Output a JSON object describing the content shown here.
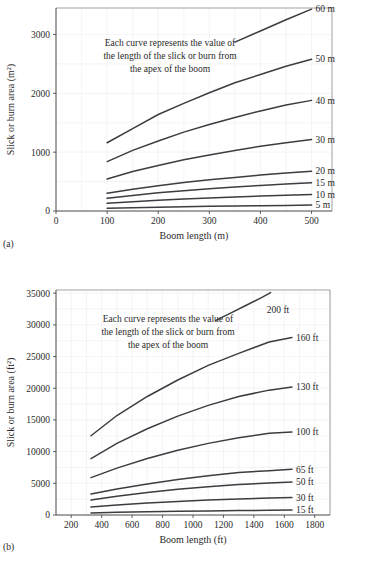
{
  "figure": {
    "panel_a_letter": "(a)",
    "panel_b_letter": "(b)",
    "annotation_line1": "Each curve represents the value of",
    "annotation_line2": "the length of the slick or burn from",
    "annotation_line3": "the apex of the boom",
    "curve_color": "#3c3c42",
    "grid_color": "#e9e7ea",
    "axis_color": "#3a3a3a"
  },
  "chart_data": [
    {
      "type": "line",
      "id": "panel-a",
      "title": "",
      "xlabel": "Boom length (m)",
      "ylabel": "Slick or burn area (m²)",
      "xlim": [
        0,
        540
      ],
      "ylim": [
        0,
        3450
      ],
      "xticks": [
        0,
        100,
        200,
        300,
        400,
        500
      ],
      "yticks": [
        0,
        1000,
        2000,
        3000
      ],
      "xtick_labels": [
        "0",
        "100",
        "200",
        "300",
        "400",
        "500"
      ],
      "ytick_labels": [
        "0",
        "1000",
        "2000",
        "3000"
      ],
      "grid": true,
      "legend_position": "right-of-curve-end",
      "annotation": "Each curve represents the value of the length of the slick or burn from the apex of the boom",
      "series": [
        {
          "name": "60 m",
          "label": "60 m",
          "x": [
            350,
            400,
            450,
            500
          ],
          "y": [
            2870,
            3060,
            3250,
            3430
          ]
        },
        {
          "name": "50 m",
          "label": "50 m",
          "x": [
            100,
            150,
            200,
            250,
            300,
            350,
            400,
            450,
            500
          ],
          "y": [
            1160,
            1400,
            1640,
            1830,
            2010,
            2180,
            2320,
            2460,
            2580
          ]
        },
        {
          "name": "40 m",
          "label": "40 m",
          "x": [
            100,
            150,
            200,
            250,
            300,
            350,
            400,
            450,
            500
          ],
          "y": [
            840,
            1030,
            1190,
            1340,
            1470,
            1590,
            1700,
            1800,
            1880
          ]
        },
        {
          "name": "30 m",
          "label": "30 m",
          "x": [
            100,
            150,
            200,
            250,
            300,
            350,
            400,
            450,
            500
          ],
          "y": [
            545,
            670,
            775,
            870,
            950,
            1030,
            1100,
            1160,
            1215
          ]
        },
        {
          "name": "20 m",
          "label": "20 m",
          "x": [
            100,
            150,
            200,
            250,
            300,
            350,
            400,
            450,
            500
          ],
          "y": [
            300,
            370,
            430,
            485,
            530,
            570,
            610,
            645,
            675
          ]
        },
        {
          "name": "15 m",
          "label": "15 m",
          "x": [
            100,
            150,
            200,
            250,
            300,
            350,
            400,
            450,
            500
          ],
          "y": [
            215,
            265,
            310,
            345,
            380,
            410,
            435,
            460,
            480
          ]
        },
        {
          "name": "10 m",
          "label": "10 m",
          "x": [
            100,
            150,
            200,
            250,
            300,
            350,
            400,
            450,
            500
          ],
          "y": [
            130,
            158,
            182,
            203,
            222,
            240,
            255,
            268,
            280
          ]
        },
        {
          "name": "5 m",
          "label": "5 m",
          "x": [
            100,
            150,
            200,
            250,
            300,
            350,
            400,
            450,
            500
          ],
          "y": [
            45,
            55,
            64,
            72,
            79,
            85,
            90,
            95,
            100
          ]
        }
      ]
    },
    {
      "type": "line",
      "id": "panel-b",
      "title": "",
      "xlabel": "Boom length (ft)",
      "ylabel": "Slick or burn area (ft²)",
      "xlim": [
        100,
        1900
      ],
      "ylim": [
        0,
        35500
      ],
      "xticks": [
        200,
        400,
        600,
        800,
        1000,
        1200,
        1400,
        1600,
        1800
      ],
      "yticks": [
        0,
        5000,
        10000,
        15000,
        20000,
        25000,
        30000,
        35000
      ],
      "xtick_labels": [
        "200",
        "400",
        "600",
        "800",
        "1000",
        "1200",
        "1400",
        "1600",
        "1800"
      ],
      "ytick_labels": [
        "0",
        "5000",
        "10000",
        "15000",
        "20000",
        "25000",
        "30000",
        "35000"
      ],
      "grid": true,
      "legend_position": "right-of-curve-end",
      "annotation": "Each curve represents the value of the length of the slick or burn from the apex of the boom",
      "series": [
        {
          "name": "200 ft",
          "label": "200 ft",
          "x": [
            1150,
            1250,
            1350,
            1450,
            1510
          ],
          "y": [
            30700,
            31900,
            33100,
            34300,
            35100
          ]
        },
        {
          "name": "160 ft",
          "label": "160 ft",
          "x": [
            330,
            500,
            700,
            900,
            1100,
            1300,
            1500,
            1650
          ],
          "y": [
            12500,
            15700,
            18700,
            21300,
            23600,
            25500,
            27300,
            28000
          ]
        },
        {
          "name": "130 ft",
          "label": "130 ft",
          "x": [
            330,
            500,
            700,
            900,
            1100,
            1300,
            1500,
            1650
          ],
          "y": [
            8900,
            11300,
            13600,
            15600,
            17300,
            18700,
            19700,
            20200
          ]
        },
        {
          "name": "100 ft",
          "label": "100 ft",
          "x": [
            330,
            500,
            700,
            900,
            1100,
            1300,
            1500,
            1650
          ],
          "y": [
            5900,
            7400,
            8900,
            10200,
            11300,
            12200,
            12900,
            13100
          ]
        },
        {
          "name": "65 ft",
          "label": "65 ft",
          "x": [
            330,
            500,
            700,
            900,
            1100,
            1300,
            1500,
            1650
          ],
          "y": [
            3300,
            4100,
            4900,
            5600,
            6200,
            6700,
            7000,
            7200
          ]
        },
        {
          "name": "50 ft",
          "label": "50 ft",
          "x": [
            330,
            500,
            700,
            900,
            1100,
            1300,
            1500,
            1650
          ],
          "y": [
            2350,
            2950,
            3550,
            4050,
            4450,
            4800,
            5050,
            5200
          ]
        },
        {
          "name": "30 ft",
          "label": "30 ft",
          "x": [
            330,
            500,
            700,
            900,
            1100,
            1300,
            1500,
            1650
          ],
          "y": [
            1250,
            1560,
            1880,
            2140,
            2360,
            2540,
            2680,
            2750
          ]
        },
        {
          "name": "15 ft",
          "label": "15 ft",
          "x": [
            330,
            500,
            700,
            900,
            1100,
            1300,
            1500,
            1650
          ],
          "y": [
            330,
            420,
            510,
            590,
            650,
            700,
            740,
            770
          ]
        }
      ]
    }
  ]
}
